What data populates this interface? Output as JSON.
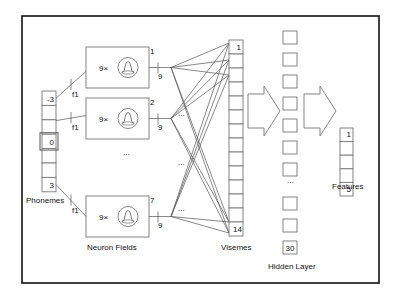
{
  "diagram": {
    "phonemes": {
      "label": "Phonemes",
      "cells": [
        "-3",
        "",
        "",
        "0",
        "",
        "",
        "3"
      ],
      "highlighted_index": 3
    },
    "neuron_fields": {
      "label": "Neuron Fields",
      "fields": [
        {
          "index": "1",
          "multiplier": "9×",
          "input_width": "f1",
          "output_width": "9"
        },
        {
          "index": "2",
          "multiplier": "9×",
          "input_width": "f1",
          "output_width": "9"
        },
        {
          "index": "7",
          "multiplier": "9×",
          "input_width": "f1",
          "output_width": "9"
        }
      ],
      "ellipsis": "..."
    },
    "connection_ellipsis": "...",
    "visemes": {
      "label": "Visemes",
      "count": 14,
      "first": "1",
      "last": "14"
    },
    "hidden_layer": {
      "label": "Hidden Layer",
      "visible_boxes_top": 7,
      "visible_boxes_bottom": 3,
      "last": "30",
      "ellipsis": "..."
    },
    "features": {
      "label": "Features",
      "count": 5,
      "first": "1",
      "last": "5"
    }
  }
}
